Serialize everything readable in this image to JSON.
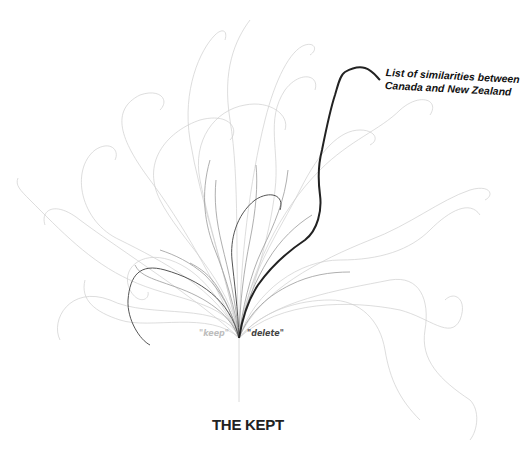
{
  "diagram": {
    "title": "THE KEPT",
    "root_labels": {
      "left": "\"keep\"",
      "right": "\"delete\""
    },
    "highlighted_path_label": {
      "line1": "List of similarities between",
      "line2": "Canada and New Zealand"
    },
    "colors": {
      "background": "#ffffff",
      "faint_branches": "#c8c8c8",
      "mid_branches": "#8a8a8a",
      "highlight_path": "#222222",
      "keep_label": "#bdbdbd",
      "delete_label": "#444444"
    }
  }
}
